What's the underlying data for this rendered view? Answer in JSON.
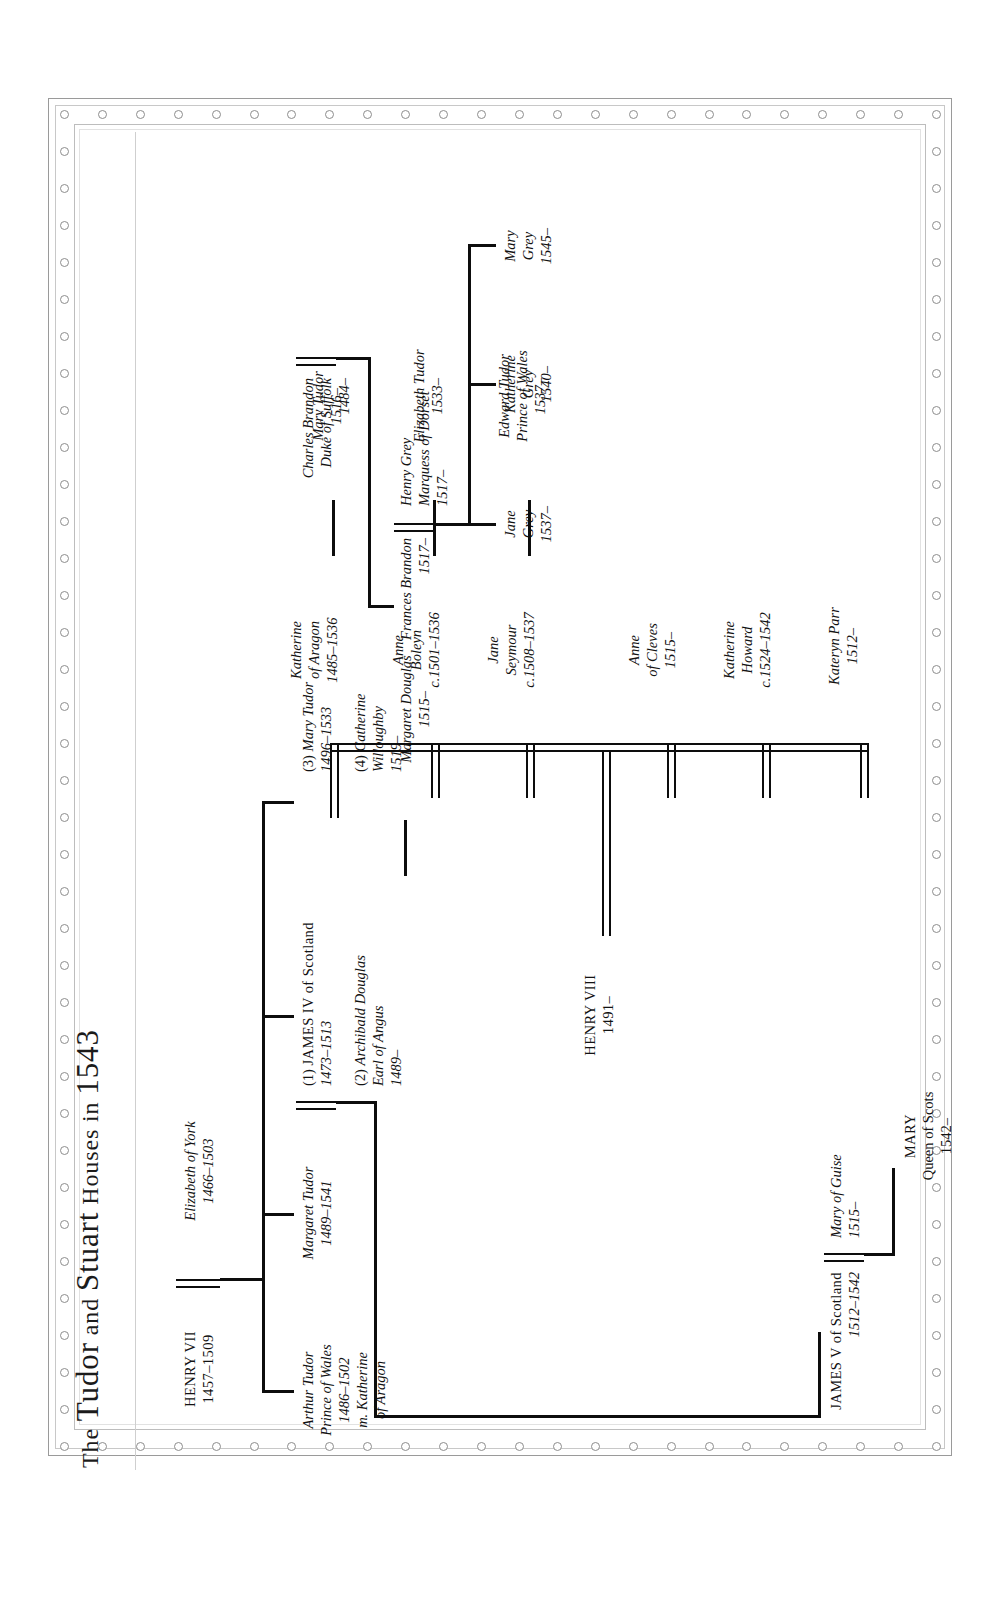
{
  "document": {
    "title_the": "The ",
    "title_tudor": "Tudor",
    "title_and": " and ",
    "title_stuart": "Stuart",
    "title_houses": " Houses ",
    "title_in": "in ",
    "title_year": "1543",
    "title_full": "THE TUDOR AND STUART HOUSES IN 1543",
    "ink_color": "#121212",
    "rule_color": "#cfcfcf",
    "frame_color": "#9a9a9a",
    "background": "#ffffff",
    "orientation": "rotated-90-left"
  },
  "people": {
    "henry_vii": {
      "name": "HENRY VII",
      "dates": "1457–1509"
    },
    "elizabeth_york": {
      "name": "Elizabeth of York",
      "dates": "1466–1503"
    },
    "arthur_tudor": {
      "name": "Arthur Tudor",
      "line2": "Prince of Wales",
      "dates": "1486–1502",
      "line4": "m. Katherine",
      "line5": "of Aragon"
    },
    "margaret_tudor": {
      "name": "Margaret Tudor",
      "dates": "1489–1541"
    },
    "james_iv": {
      "prefix": "(1) ",
      "name": "JAMES IV of Scotland",
      "dates": "1473–1513"
    },
    "archibald_douglas": {
      "prefix": "(2) ",
      "name": "Archibald Douglas",
      "line2": "Earl of Angus",
      "dates": "1489–"
    },
    "margaret_douglas": {
      "name": "Margaret Douglas",
      "dates": "1515–"
    },
    "james_v": {
      "name": "JAMES V of Scotland",
      "dates": "1512–1542"
    },
    "mary_guise": {
      "name": "Mary of Guise",
      "dates": "1515–"
    },
    "mary_queen_scots": {
      "name": "MARY",
      "line2": "Queen of Scots",
      "dates": "1542–"
    },
    "henry_viii": {
      "name": "HENRY VIII",
      "dates": "1491–"
    },
    "katherine_aragon": {
      "name": "Katherine",
      "line2": "of Aragon",
      "dates": "1485–1536"
    },
    "anne_boleyn": {
      "name": "Anne",
      "line2": "Boleyn",
      "dates": "c.1501–1536"
    },
    "jane_seymour": {
      "name": "Jane",
      "line2": "Seymour",
      "dates": "c.1508–1537"
    },
    "anne_cleves": {
      "name": "Anne",
      "line2": "of Cleves",
      "dates": "1515–"
    },
    "katherine_howard": {
      "name": "Katherine",
      "line2": "Howard",
      "dates": "c.1524–1542"
    },
    "kateryn_parr": {
      "name": "Kateryn Parr",
      "dates": "1512–"
    },
    "mary_tudor_daughter": {
      "name": "Mary Tudor",
      "dates": "1516–"
    },
    "elizabeth_tudor": {
      "name": "Elizabeth Tudor",
      "dates": "1533–"
    },
    "edward_tudor": {
      "name": "Edward Tudor",
      "line2": "Prince of Wales",
      "dates": "1537–"
    },
    "mary_tudor_sister": {
      "prefix": "(3) ",
      "name": "Mary Tudor",
      "dates": "1496–1533"
    },
    "catherine_willoughby": {
      "prefix": "(4) ",
      "name": "Catherine",
      "line2": "Willoughby",
      "dates": "1519–"
    },
    "charles_brandon": {
      "name": "Charles Brandon",
      "line2": "Duke of Suffolk",
      "dates": "1484–"
    },
    "frances_brandon": {
      "name": "Frances Brandon",
      "dates": "1517–"
    },
    "henry_grey": {
      "name": "Henry Grey",
      "line2": "Marquess of Dorset",
      "dates": "1517–"
    },
    "jane_grey": {
      "name": "Jane",
      "line2": "Grey",
      "dates": "1537–"
    },
    "katherine_grey": {
      "name": "Katherine",
      "line2": "Grey",
      "dates": "1540–"
    },
    "mary_grey": {
      "name": "Mary",
      "line2": "Grey",
      "dates": "1545–"
    }
  }
}
